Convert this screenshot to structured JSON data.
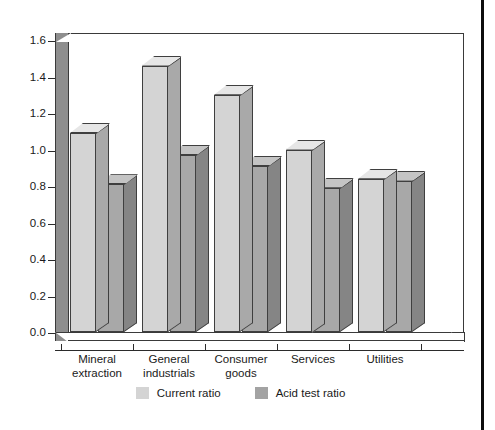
{
  "chart_data": {
    "type": "bar",
    "title": "",
    "subtitle": "",
    "xlabel": "",
    "ylabel": "",
    "ylim": [
      0.0,
      1.6
    ],
    "grid": false,
    "legend_position": "bottom-center",
    "style": "3d-clustered-column-grayscale",
    "categories": [
      "Mineral extraction",
      "General industrials",
      "Consumer goods",
      "Services",
      "Utilities"
    ],
    "category_lines": [
      [
        "Mineral",
        "extraction"
      ],
      [
        "General",
        "industrials"
      ],
      [
        "Consumer",
        "goods"
      ],
      [
        "Services",
        ""
      ],
      [
        "Utilities",
        ""
      ]
    ],
    "ytick_labels": [
      "0.0",
      "0.2",
      "0.4",
      "0.6",
      "0.8",
      "1.0",
      "1.2",
      "1.4",
      "1.6"
    ],
    "ytick_values": [
      0.0,
      0.2,
      0.4,
      0.6,
      0.8,
      1.0,
      1.2,
      1.4,
      1.6
    ],
    "series": [
      {
        "name": "Current ratio",
        "color": "#d4d4d4",
        "values": [
          1.09,
          1.46,
          1.3,
          1.0,
          0.84
        ]
      },
      {
        "name": "Acid test ratio",
        "color": "#a3a3a3",
        "values": [
          0.81,
          0.97,
          0.91,
          0.79,
          0.83
        ]
      }
    ]
  },
  "legend": {
    "items": [
      {
        "label": "Current ratio",
        "swatch": "#d4d4d4"
      },
      {
        "label": "Acid test ratio",
        "swatch": "#a3a3a3"
      }
    ]
  }
}
